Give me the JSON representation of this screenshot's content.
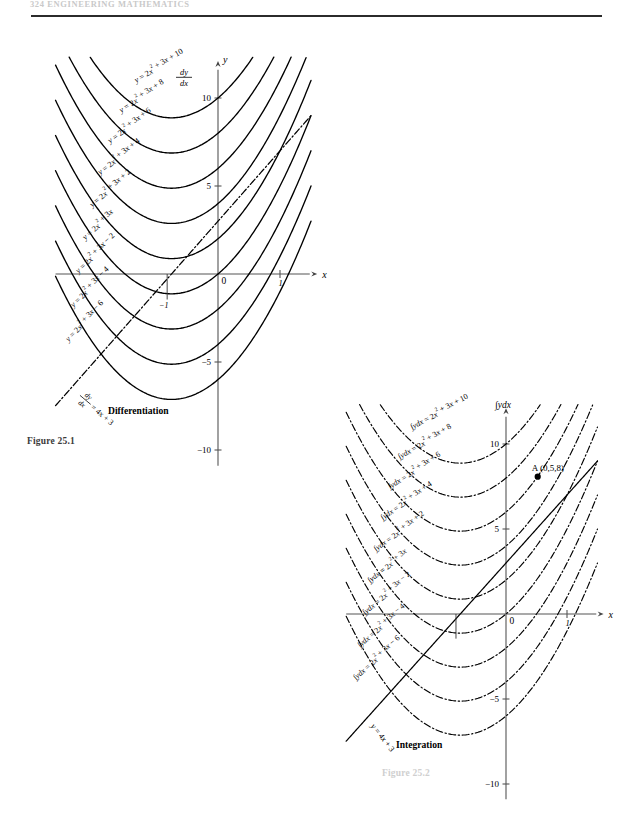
{
  "page": {
    "running_head": "324   ENGINEERING MATHEMATICS",
    "figure1_caption": "Figure 25.1",
    "figure2_caption": "Figure 25.2"
  },
  "figure1": {
    "name": "Figure 25.1",
    "process_label": "Differentiation",
    "y_axis_label": "y",
    "x_axis_label": "x",
    "derivative_axis_label_num": "dy",
    "derivative_axis_label_den": "dx",
    "y_ticks": [
      "10",
      "5",
      "0",
      "-5",
      "-10"
    ],
    "x_ticks": [
      "1"
    ],
    "origin_label": "0",
    "x_neg_tick": "-1",
    "curve_labels": [
      "y = 2x² + 3x + 10",
      "y = 2x² + 3x + 8",
      "y = 2x² + 3x + 6",
      "y = 2x² + 3x + 4",
      "y = 2x² + 3x + 2",
      "y = 2x² + 3x",
      "y = 2x² + 3x − 2",
      "y = 2x² + 3x − 4",
      "y = 2x² + 3x − 6"
    ],
    "line_label_num": "dy",
    "line_label_den": "dx",
    "line_label_rhs": "= 4x + 3"
  },
  "figure2": {
    "name": "Figure 25.2",
    "process_label": "Integration",
    "y_axis_label": "∫ydx",
    "x_axis_label": "x",
    "y_ticks": [
      "10",
      "5",
      "0",
      "-5",
      "-10"
    ],
    "x_ticks": [
      "1"
    ],
    "origin_label": "0",
    "point_label": "A (0,5,8)",
    "curve_labels": [
      "∫ydx = 2x² + 3x + 10",
      "∫ydx = 2x² + 3x + 8",
      "∫ydx = 2x² + 3x + 6",
      "∫ydx = 2x² + 3x + 4",
      "∫ydx = 2x² + 3x + 2",
      "∫ydx = 2x² + 3x",
      "∫ydx = 2x² + 3x − 2",
      "∫ydx = 2x² + 3x − 4",
      "∫ydx = 2x² + 3x − 6"
    ],
    "line_label": "y = 4x + 3"
  },
  "chart_data": [
    {
      "type": "line",
      "title": "Figure 25.1 — Differentiation",
      "xlabel": "x",
      "ylabel": "y",
      "xlim": [
        -2.6,
        1.6
      ],
      "ylim": [
        -11,
        12
      ],
      "grid": false,
      "legend": "inline curve labels",
      "annotations": [
        "Differentiation"
      ],
      "series": [
        {
          "name": "y = 2x² + 3x + 10",
          "formula": "2*x^2 + 3*x + 10",
          "style": "solid",
          "c": 10
        },
        {
          "name": "y = 2x² + 3x + 8",
          "formula": "2*x^2 + 3*x + 8",
          "style": "solid",
          "c": 8
        },
        {
          "name": "y = 2x² + 3x + 6",
          "formula": "2*x^2 + 3*x + 6",
          "style": "solid",
          "c": 6
        },
        {
          "name": "y = 2x² + 3x + 4",
          "formula": "2*x^2 + 3*x + 4",
          "style": "solid",
          "c": 4
        },
        {
          "name": "y = 2x² + 3x + 2",
          "formula": "2*x^2 + 3*x + 2",
          "style": "solid",
          "c": 2
        },
        {
          "name": "y = 2x² + 3x",
          "formula": "2*x^2 + 3*x",
          "style": "solid",
          "c": 0
        },
        {
          "name": "y = 2x² + 3x − 2",
          "formula": "2*x^2 + 3*x - 2",
          "style": "solid",
          "c": -2
        },
        {
          "name": "y = 2x² + 3x − 4",
          "formula": "2*x^2 + 3*x - 4",
          "style": "solid",
          "c": -4
        },
        {
          "name": "y = 2x² + 3x − 6",
          "formula": "2*x^2 + 3*x - 6",
          "style": "solid",
          "c": -6
        },
        {
          "name": "dy/dx = 4x + 3",
          "formula": "4*x + 3",
          "style": "dash-dot",
          "c": 3
        }
      ]
    },
    {
      "type": "line",
      "title": "Figure 25.2 — Integration",
      "xlabel": "x",
      "ylabel": "∫ydx",
      "xlim": [
        -2.6,
        1.6
      ],
      "ylim": [
        -11,
        12
      ],
      "grid": false,
      "legend": "inline curve labels",
      "annotations": [
        "Integration",
        "A (0,5,8)"
      ],
      "points": [
        {
          "label": "A (0,5,8)",
          "x": 0.5,
          "y": 8
        }
      ],
      "series": [
        {
          "name": "∫ydx = 2x² + 3x + 10",
          "formula": "2*x^2 + 3*x + 10",
          "style": "dash-dot",
          "c": 10
        },
        {
          "name": "∫ydx = 2x² + 3x + 8",
          "formula": "2*x^2 + 3*x + 8",
          "style": "dash-dot",
          "c": 8
        },
        {
          "name": "∫ydx = 2x² + 3x + 6",
          "formula": "2*x^2 + 3*x + 6",
          "style": "dash-dot",
          "c": 6
        },
        {
          "name": "∫ydx = 2x² + 3x + 4",
          "formula": "2*x^2 + 3*x + 4",
          "style": "dash-dot",
          "c": 4
        },
        {
          "name": "∫ydx = 2x² + 3x + 2",
          "formula": "2*x^2 + 3*x + 2",
          "style": "dash-dot",
          "c": 2
        },
        {
          "name": "∫ydx = 2x² + 3x",
          "formula": "2*x^2 + 3*x",
          "style": "dash-dot",
          "c": 0
        },
        {
          "name": "∫ydx = 2x² + 3x − 2",
          "formula": "2*x^2 + 3*x - 2",
          "style": "dash-dot",
          "c": -2
        },
        {
          "name": "∫ydx = 2x² + 3x − 4",
          "formula": "2*x^2 + 3*x - 4",
          "style": "dash-dot",
          "c": -4
        },
        {
          "name": "∫ydx = 2x² + 3x − 6",
          "formula": "2*x^2 + 3*x - 6",
          "style": "dash-dot",
          "c": -6
        },
        {
          "name": "y = 4x + 3",
          "formula": "4*x + 3",
          "style": "solid",
          "c": 3
        }
      ]
    }
  ]
}
